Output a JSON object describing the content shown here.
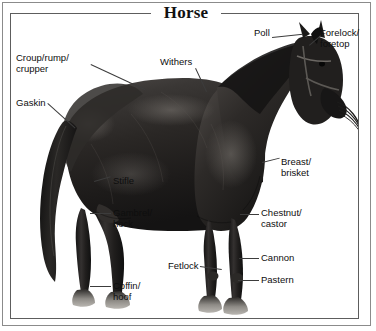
{
  "figure": {
    "title": "Horse",
    "background_color": "#ffffff",
    "frame_color": "#8b8b8b",
    "inner_frame_color": "#5d5d5d",
    "text_color": "#0e0e0e",
    "leader_color": "#3c3c3c"
  },
  "labels": [
    {
      "id": "croup",
      "text": "Croup/rump/\ncrupper",
      "x": 16,
      "y": 53
    },
    {
      "id": "gaskin",
      "text": "Gaskin",
      "x": 16,
      "y": 98
    },
    {
      "id": "withers",
      "text": "Withers",
      "x": 160,
      "y": 57
    },
    {
      "id": "poll",
      "text": "Poll",
      "x": 254,
      "y": 28
    },
    {
      "id": "forelock",
      "text": "Forelock/\nforetop",
      "x": 320,
      "y": 28
    },
    {
      "id": "breast",
      "text": "Breast/\nbrisket",
      "x": 280,
      "y": 160
    },
    {
      "id": "chestnut",
      "text": "Chestnut/\ncastor",
      "x": 260,
      "y": 207
    },
    {
      "id": "cannon",
      "text": "Cannon",
      "x": 260,
      "y": 254
    },
    {
      "id": "pastern",
      "text": "Pastern",
      "x": 260,
      "y": 276
    },
    {
      "id": "stifle",
      "text": "Stifle",
      "x": 112,
      "y": 182
    },
    {
      "id": "gambrel",
      "text": "Gambrel/\nhock",
      "x": 112,
      "y": 209
    },
    {
      "id": "coffin",
      "text": "Coffin/\nhoof",
      "x": 112,
      "y": 282
    },
    {
      "id": "fetlock",
      "text": "Fetlock",
      "x": 168,
      "y": 258
    }
  ],
  "anatomy_parts": [
    "Croup/rump/crupper",
    "Gaskin",
    "Withers",
    "Poll",
    "Forelock/foretop",
    "Breast/brisket",
    "Chestnut/castor",
    "Cannon",
    "Pastern",
    "Stifle",
    "Gambrel/hock",
    "Coffin/hoof",
    "Fetlock"
  ]
}
